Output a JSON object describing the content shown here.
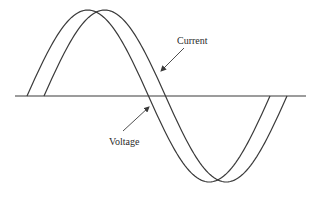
{
  "diagram": {
    "labels": {
      "current": "Current",
      "voltage": "Voltage"
    },
    "colors": {
      "stroke": "#3a3a3a",
      "background": "#ffffff"
    },
    "axis": {
      "y": 96,
      "x_start": 15,
      "x_end": 306
    },
    "waves": [
      {
        "name": "Voltage",
        "start_x": 27,
        "period_px": 243,
        "amplitude_px": 86,
        "phase_order": "leading"
      },
      {
        "name": "Current",
        "start_x": 44,
        "period_px": 243,
        "amplitude_px": 86,
        "phase_order": "lagging"
      }
    ],
    "annotations": [
      {
        "text": "Current",
        "arrow_from": [
          184,
          48
        ],
        "arrow_to": [
          161,
          71
        ]
      },
      {
        "text": "Voltage",
        "arrow_from": [
          123,
          131
        ],
        "arrow_to": [
          149,
          107
        ]
      }
    ]
  }
}
